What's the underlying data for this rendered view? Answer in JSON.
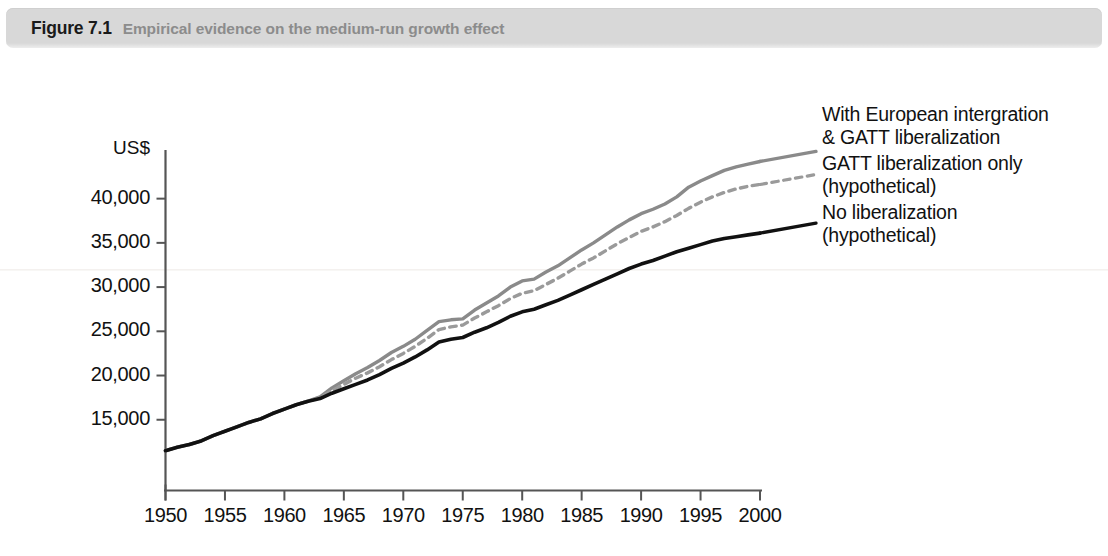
{
  "header": {
    "figure_number": "Figure 7.1",
    "title": "Empirical evidence on the medium-run growth effect"
  },
  "axis": {
    "units_label": "US$",
    "y_ticks": [
      "40,000",
      "35,000",
      "30,000",
      "25,000",
      "20,000",
      "15,000"
    ],
    "x_ticks": [
      "1950",
      "1955",
      "1960",
      "1965",
      "1970",
      "1975",
      "1980",
      "1985",
      "1990",
      "1995",
      "2000"
    ]
  },
  "legend": {
    "items": [
      {
        "line1": "With European intergration",
        "line2": "& GATT liberalization"
      },
      {
        "line1": "GATT liberalization only",
        "line2": "(hypothetical)"
      },
      {
        "line1": "No liberalization",
        "line2": "(hypothetical)"
      }
    ]
  },
  "colors": {
    "header_bar": "#d8d8d8",
    "figure_number": "#1a1a1a",
    "title_text": "#8c8c8c",
    "series_actual": "#8a8a8a",
    "series_gatt_only": "#9a9a9a",
    "series_no_liberalization": "#111111",
    "axis": "#555555",
    "background": "#ffffff"
  },
  "chart_data": {
    "type": "line",
    "title": "Empirical evidence on the medium-run growth effect",
    "xlabel": "",
    "ylabel": "US$",
    "xlim": [
      1950,
      2000
    ],
    "ylim": [
      7000,
      45500
    ],
    "grid": false,
    "legend_position": "right",
    "x": [
      1950,
      1951,
      1952,
      1953,
      1954,
      1955,
      1956,
      1957,
      1958,
      1959,
      1960,
      1961,
      1962,
      1963,
      1964,
      1965,
      1966,
      1967,
      1968,
      1969,
      1970,
      1971,
      1972,
      1973,
      1974,
      1975,
      1976,
      1977,
      1978,
      1979,
      1980,
      1981,
      1982,
      1983,
      1984,
      1985,
      1986,
      1987,
      1988,
      1989,
      1990,
      1991,
      1992,
      1993,
      1994,
      1995,
      1996,
      1997,
      1998,
      1999,
      2000
    ],
    "series": [
      {
        "name": "With European intergration & GATT liberalization",
        "style": "solid",
        "color": "#8a8a8a",
        "values": [
          11500,
          11900,
          12200,
          12600,
          13200,
          13700,
          14200,
          14700,
          15100,
          15700,
          16200,
          16700,
          17100,
          17600,
          18600,
          19400,
          20200,
          20900,
          21700,
          22600,
          23300,
          24100,
          25100,
          26100,
          26300,
          26400,
          27400,
          28200,
          29000,
          30000,
          30700,
          30900,
          31700,
          32400,
          33300,
          34200,
          35000,
          35900,
          36800,
          37600,
          38300,
          38800,
          39400,
          40200,
          41300,
          42000,
          42600,
          43200,
          43600,
          43900,
          44200
        ]
      },
      {
        "name": "GATT liberalization only (hypothetical)",
        "style": "dashed",
        "color": "#9a9a9a",
        "values": [
          11500,
          11900,
          12200,
          12600,
          13200,
          13700,
          14200,
          14700,
          15100,
          15700,
          16200,
          16700,
          17100,
          17500,
          18300,
          19000,
          19700,
          20300,
          21000,
          21800,
          22500,
          23300,
          24200,
          25200,
          25500,
          25700,
          26500,
          27200,
          27900,
          28700,
          29300,
          29600,
          30300,
          31000,
          31800,
          32600,
          33300,
          34100,
          34900,
          35600,
          36300,
          36800,
          37400,
          38100,
          38900,
          39600,
          40200,
          40700,
          41100,
          41400,
          41600
        ]
      },
      {
        "name": "No liberalization (hypothetical)",
        "style": "solid",
        "color": "#111111",
        "values": [
          11500,
          11900,
          12200,
          12600,
          13200,
          13700,
          14200,
          14700,
          15100,
          15700,
          16200,
          16700,
          17100,
          17400,
          18000,
          18500,
          19000,
          19500,
          20100,
          20800,
          21400,
          22100,
          22900,
          23800,
          24100,
          24300,
          24900,
          25400,
          26000,
          26700,
          27200,
          27500,
          28000,
          28500,
          29100,
          29700,
          30300,
          30900,
          31500,
          32100,
          32600,
          33000,
          33500,
          34000,
          34400,
          34800,
          35200,
          35500,
          35700,
          35900,
          36100
        ]
      }
    ]
  }
}
